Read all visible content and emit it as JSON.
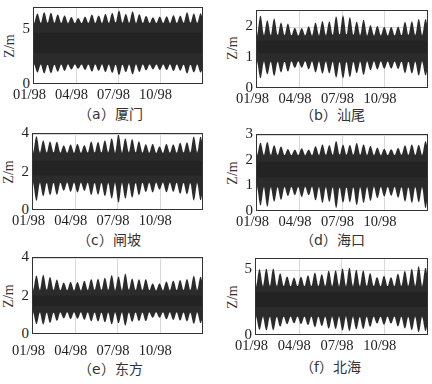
{
  "figure": {
    "ylabel": "Z/m",
    "xtick_labels": [
      "01/98",
      "04/98",
      "07/98",
      "10/98"
    ]
  },
  "chart_data": [
    {
      "type": "line",
      "panel": "a",
      "title": "（a）厦门",
      "station": "厦门",
      "xlabel": "",
      "ylabel": "Z/m",
      "x_ticks": [
        "01/98",
        "04/98",
        "07/98",
        "10/98"
      ],
      "y_ticks": [
        0,
        5
      ],
      "ylim": [
        0,
        7
      ],
      "grid": true,
      "series": [
        {
          "name": "tide level",
          "mean": 3.9,
          "high_range": [
            5.6,
            6.9
          ],
          "low_range": [
            0.8,
            1.9
          ]
        }
      ]
    },
    {
      "type": "line",
      "panel": "b",
      "title": "（b）汕尾",
      "station": "汕尾",
      "xlabel": "",
      "ylabel": "Z/m",
      "x_ticks": [
        "01/98",
        "04/98",
        "07/98",
        "10/98"
      ],
      "y_ticks": [
        0,
        1,
        2
      ],
      "ylim": [
        0,
        2.5
      ],
      "grid": true,
      "series": [
        {
          "name": "tide level",
          "mean": 1.4,
          "high_range": [
            1.7,
            2.4
          ],
          "low_range": [
            0.3,
            0.9
          ]
        }
      ]
    },
    {
      "type": "line",
      "panel": "c",
      "title": "（c）闸坡",
      "station": "闸坡",
      "xlabel": "",
      "ylabel": "Z/m",
      "x_ticks": [
        "01/98",
        "04/98",
        "07/98",
        "10/98"
      ],
      "y_ticks": [
        0,
        2,
        4
      ],
      "ylim": [
        0,
        4
      ],
      "grid": true,
      "series": [
        {
          "name": "tide level",
          "mean": 2.2,
          "high_range": [
            3.0,
            4.0
          ],
          "low_range": [
            0.4,
            1.5
          ]
        }
      ]
    },
    {
      "type": "line",
      "panel": "d",
      "title": "（d）海口",
      "station": "海口",
      "xlabel": "",
      "ylabel": "Z/m",
      "x_ticks": [
        "01/98",
        "04/98",
        "07/98",
        "10/98"
      ],
      "y_ticks": [
        0,
        1,
        2,
        3
      ],
      "ylim": [
        0,
        3
      ],
      "grid": true,
      "series": [
        {
          "name": "tide level",
          "mean": 1.7,
          "high_range": [
            2.2,
            2.8
          ],
          "low_range": [
            0.1,
            1.0
          ]
        }
      ]
    },
    {
      "type": "line",
      "panel": "e",
      "title": "（e）东方",
      "station": "东方",
      "xlabel": "",
      "ylabel": "Z/m",
      "x_ticks": [
        "01/98",
        "04/98",
        "07/98",
        "10/98"
      ],
      "y_ticks": [
        0,
        2,
        4
      ],
      "ylim": [
        0,
        4
      ],
      "grid": true,
      "series": [
        {
          "name": "tide level",
          "mean": 1.8,
          "high_range": [
            2.3,
            3.3
          ],
          "low_range": [
            0.4,
            1.2
          ]
        }
      ]
    },
    {
      "type": "line",
      "panel": "f",
      "title": "（f）北海",
      "station": "北海",
      "xlabel": "",
      "ylabel": "Z/m",
      "x_ticks": [
        "01/98",
        "04/98",
        "07/98",
        "10/98"
      ],
      "y_ticks": [
        0,
        5
      ],
      "ylim": [
        0,
        5.8
      ],
      "grid": true,
      "series": [
        {
          "name": "tide level",
          "mean": 2.9,
          "high_range": [
            3.7,
            5.5
          ],
          "low_range": [
            0.1,
            1.5
          ]
        }
      ]
    }
  ]
}
